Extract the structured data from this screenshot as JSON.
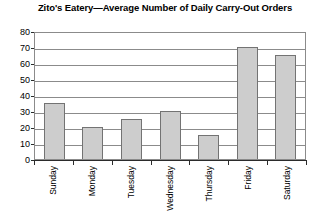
{
  "chart_data": {
    "type": "bar",
    "title": "Zito's Eatery—Average Number of Daily Carry-Out Orders",
    "xlabel": "",
    "ylabel": "",
    "categories": [
      "Sunday",
      "Monday",
      "Tuesday",
      "Wednesday",
      "Thursday",
      "Friday",
      "Saturday"
    ],
    "values": [
      35,
      20,
      25,
      30,
      15,
      70,
      65
    ],
    "ylim": [
      0,
      80
    ],
    "ytick_labels": [
      "80",
      "70",
      "60",
      "50",
      "40",
      "30",
      "20",
      "10",
      "0"
    ],
    "ytick_values": [
      80,
      70,
      60,
      50,
      40,
      30,
      20,
      10,
      0
    ],
    "ytick_step": 10,
    "grid": true,
    "legend": false,
    "bar_fill_color": "#cdcdcd",
    "bar_border_color": "#737373",
    "axis_color": "#2b2b2b",
    "gridline_color": "#8b8b8b",
    "background_color": "#ffffff"
  }
}
